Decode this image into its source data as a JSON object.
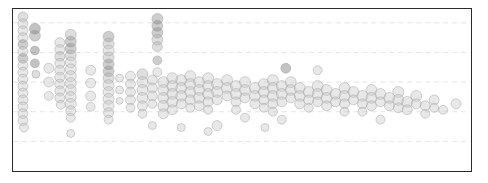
{
  "figure": {
    "title": "",
    "xlabel": "",
    "ylabel": "",
    "frame_color": "#2b2b2b",
    "background": "#ffffff",
    "gridline_color": "#d9d9d9"
  },
  "chart_data": {
    "type": "scatter",
    "title": "",
    "xlabel": "",
    "ylabel": "",
    "xlim": [
      0,
      460
    ],
    "ylim": [
      0,
      164
    ],
    "grid": true,
    "grid_orientation": "horizontal",
    "gridline_y": [
      14,
      44,
      74,
      104,
      134
    ],
    "legend": null,
    "marker": "circle",
    "marker_opacity": 0.42,
    "colors": {
      "light": "#c9c9c9",
      "mid": "#b0b0b0",
      "dark": "#8a8a8a",
      "darkest": "#6e6e6e"
    },
    "points": [
      {
        "x": 10,
        "y": 8,
        "r": 5.0,
        "c": "mid"
      },
      {
        "x": 10,
        "y": 15,
        "r": 5.0,
        "c": "light"
      },
      {
        "x": 10,
        "y": 22,
        "r": 5.0,
        "c": "light"
      },
      {
        "x": 10,
        "y": 29,
        "r": 5.0,
        "c": "light"
      },
      {
        "x": 10,
        "y": 36,
        "r": 5.0,
        "c": "dark"
      },
      {
        "x": 10,
        "y": 43,
        "r": 5.0,
        "c": "light"
      },
      {
        "x": 10,
        "y": 50,
        "r": 5.0,
        "c": "dark"
      },
      {
        "x": 10,
        "y": 57,
        "r": 5.0,
        "c": "light"
      },
      {
        "x": 10,
        "y": 64,
        "r": 5.0,
        "c": "light"
      },
      {
        "x": 10,
        "y": 71,
        "r": 5.0,
        "c": "light"
      },
      {
        "x": 10,
        "y": 78,
        "r": 5.0,
        "c": "light"
      },
      {
        "x": 10,
        "y": 85,
        "r": 5.0,
        "c": "light"
      },
      {
        "x": 10,
        "y": 92,
        "r": 5.0,
        "c": "light"
      },
      {
        "x": 10,
        "y": 99,
        "r": 5.0,
        "c": "light"
      },
      {
        "x": 10,
        "y": 106,
        "r": 5.0,
        "c": "light"
      },
      {
        "x": 10,
        "y": 113,
        "r": 5.0,
        "c": "light"
      },
      {
        "x": 11,
        "y": 120,
        "r": 4.5,
        "c": "light"
      },
      {
        "x": 22,
        "y": 20,
        "r": 5.5,
        "c": "darkest"
      },
      {
        "x": 22,
        "y": 27,
        "r": 5.5,
        "c": "dark"
      },
      {
        "x": 22,
        "y": 42,
        "r": 4.5,
        "c": "darkest"
      },
      {
        "x": 22,
        "y": 55,
        "r": 4.5,
        "c": "darkest"
      },
      {
        "x": 23,
        "y": 66,
        "r": 4.0,
        "c": "mid"
      },
      {
        "x": 47,
        "y": 34,
        "r": 5.0,
        "c": "light"
      },
      {
        "x": 47,
        "y": 41,
        "r": 5.0,
        "c": "light"
      },
      {
        "x": 47,
        "y": 48,
        "r": 5.0,
        "c": "mid"
      },
      {
        "x": 47,
        "y": 55,
        "r": 5.0,
        "c": "light"
      },
      {
        "x": 47,
        "y": 62,
        "r": 5.0,
        "c": "light"
      },
      {
        "x": 47,
        "y": 69,
        "r": 5.0,
        "c": "light"
      },
      {
        "x": 47,
        "y": 76,
        "r": 5.0,
        "c": "light"
      },
      {
        "x": 47,
        "y": 83,
        "r": 5.0,
        "c": "light"
      },
      {
        "x": 47,
        "y": 90,
        "r": 5.0,
        "c": "light"
      },
      {
        "x": 48,
        "y": 97,
        "r": 4.5,
        "c": "light"
      },
      {
        "x": 58,
        "y": 26,
        "r": 5.5,
        "c": "mid"
      },
      {
        "x": 58,
        "y": 33,
        "r": 5.5,
        "c": "dark"
      },
      {
        "x": 58,
        "y": 40,
        "r": 5.5,
        "c": "dark"
      },
      {
        "x": 58,
        "y": 47,
        "r": 5.5,
        "c": "mid"
      },
      {
        "x": 58,
        "y": 54,
        "r": 5.5,
        "c": "light"
      },
      {
        "x": 58,
        "y": 61,
        "r": 5.5,
        "c": "light"
      },
      {
        "x": 58,
        "y": 68,
        "r": 5.5,
        "c": "light"
      },
      {
        "x": 58,
        "y": 75,
        "r": 5.5,
        "c": "light"
      },
      {
        "x": 58,
        "y": 82,
        "r": 5.5,
        "c": "light"
      },
      {
        "x": 58,
        "y": 89,
        "r": 5.5,
        "c": "light"
      },
      {
        "x": 58,
        "y": 96,
        "r": 5.5,
        "c": "light"
      },
      {
        "x": 58,
        "y": 103,
        "r": 5.0,
        "c": "light"
      },
      {
        "x": 58,
        "y": 110,
        "r": 4.5,
        "c": "light"
      },
      {
        "x": 36,
        "y": 60,
        "r": 5.0,
        "c": "light"
      },
      {
        "x": 36,
        "y": 74,
        "r": 5.0,
        "c": "light"
      },
      {
        "x": 36,
        "y": 88,
        "r": 4.5,
        "c": "light"
      },
      {
        "x": 78,
        "y": 62,
        "r": 5.0,
        "c": "light"
      },
      {
        "x": 78,
        "y": 75,
        "r": 5.0,
        "c": "light"
      },
      {
        "x": 78,
        "y": 88,
        "r": 5.0,
        "c": "light"
      },
      {
        "x": 78,
        "y": 99,
        "r": 4.5,
        "c": "light"
      },
      {
        "x": 96,
        "y": 28,
        "r": 5.5,
        "c": "dark"
      },
      {
        "x": 96,
        "y": 35,
        "r": 5.5,
        "c": "mid"
      },
      {
        "x": 96,
        "y": 42,
        "r": 5.5,
        "c": "light"
      },
      {
        "x": 96,
        "y": 49,
        "r": 5.5,
        "c": "mid"
      },
      {
        "x": 96,
        "y": 56,
        "r": 5.5,
        "c": "dark"
      },
      {
        "x": 96,
        "y": 63,
        "r": 5.5,
        "c": "dark"
      },
      {
        "x": 96,
        "y": 70,
        "r": 5.5,
        "c": "mid"
      },
      {
        "x": 96,
        "y": 77,
        "r": 5.5,
        "c": "light"
      },
      {
        "x": 96,
        "y": 84,
        "r": 5.5,
        "c": "light"
      },
      {
        "x": 96,
        "y": 91,
        "r": 5.5,
        "c": "light"
      },
      {
        "x": 96,
        "y": 98,
        "r": 5.5,
        "c": "light"
      },
      {
        "x": 96,
        "y": 105,
        "r": 5.0,
        "c": "light"
      },
      {
        "x": 96,
        "y": 112,
        "r": 4.5,
        "c": "light"
      },
      {
        "x": 107,
        "y": 70,
        "r": 4.0,
        "c": "light"
      },
      {
        "x": 107,
        "y": 82,
        "r": 4.0,
        "c": "light"
      },
      {
        "x": 107,
        "y": 93,
        "r": 3.5,
        "c": "light"
      },
      {
        "x": 118,
        "y": 68,
        "r": 5.0,
        "c": "light"
      },
      {
        "x": 118,
        "y": 76,
        "r": 5.0,
        "c": "light"
      },
      {
        "x": 118,
        "y": 84,
        "r": 5.0,
        "c": "light"
      },
      {
        "x": 118,
        "y": 92,
        "r": 5.0,
        "c": "light"
      },
      {
        "x": 118,
        "y": 100,
        "r": 4.5,
        "c": "light"
      },
      {
        "x": 130,
        "y": 66,
        "r": 5.5,
        "c": "mid"
      },
      {
        "x": 130,
        "y": 74,
        "r": 5.5,
        "c": "light"
      },
      {
        "x": 130,
        "y": 82,
        "r": 5.5,
        "c": "light"
      },
      {
        "x": 130,
        "y": 90,
        "r": 5.5,
        "c": "light"
      },
      {
        "x": 130,
        "y": 98,
        "r": 5.0,
        "c": "light"
      },
      {
        "x": 130,
        "y": 106,
        "r": 4.5,
        "c": "light"
      },
      {
        "x": 140,
        "y": 72,
        "r": 5.0,
        "c": "light"
      },
      {
        "x": 140,
        "y": 80,
        "r": 5.0,
        "c": "light"
      },
      {
        "x": 140,
        "y": 88,
        "r": 5.0,
        "c": "light"
      },
      {
        "x": 140,
        "y": 96,
        "r": 4.5,
        "c": "light"
      },
      {
        "x": 145,
        "y": 10,
        "r": 5.5,
        "c": "dark"
      },
      {
        "x": 145,
        "y": 17,
        "r": 5.5,
        "c": "dark"
      },
      {
        "x": 145,
        "y": 24,
        "r": 5.5,
        "c": "dark"
      },
      {
        "x": 145,
        "y": 31,
        "r": 5.5,
        "c": "mid"
      },
      {
        "x": 145,
        "y": 38,
        "r": 5.0,
        "c": "mid"
      },
      {
        "x": 145,
        "y": 52,
        "r": 4.5,
        "c": "dark"
      },
      {
        "x": 145,
        "y": 64,
        "r": 4.5,
        "c": "light"
      },
      {
        "x": 151,
        "y": 74,
        "r": 5.5,
        "c": "light"
      },
      {
        "x": 151,
        "y": 82,
        "r": 5.5,
        "c": "light"
      },
      {
        "x": 151,
        "y": 90,
        "r": 5.5,
        "c": "light"
      },
      {
        "x": 151,
        "y": 98,
        "r": 5.5,
        "c": "light"
      },
      {
        "x": 151,
        "y": 106,
        "r": 5.0,
        "c": "light"
      },
      {
        "x": 160,
        "y": 70,
        "r": 5.5,
        "c": "light"
      },
      {
        "x": 160,
        "y": 78,
        "r": 5.5,
        "c": "light"
      },
      {
        "x": 160,
        "y": 86,
        "r": 5.5,
        "c": "light"
      },
      {
        "x": 160,
        "y": 94,
        "r": 5.5,
        "c": "light"
      },
      {
        "x": 160,
        "y": 102,
        "r": 5.0,
        "c": "light"
      },
      {
        "x": 169,
        "y": 72,
        "r": 5.5,
        "c": "light"
      },
      {
        "x": 169,
        "y": 80,
        "r": 5.5,
        "c": "light"
      },
      {
        "x": 169,
        "y": 88,
        "r": 5.5,
        "c": "light"
      },
      {
        "x": 169,
        "y": 96,
        "r": 5.0,
        "c": "light"
      },
      {
        "x": 178,
        "y": 68,
        "r": 5.5,
        "c": "light"
      },
      {
        "x": 178,
        "y": 76,
        "r": 5.5,
        "c": "light"
      },
      {
        "x": 178,
        "y": 84,
        "r": 5.5,
        "c": "light"
      },
      {
        "x": 178,
        "y": 92,
        "r": 5.0,
        "c": "light"
      },
      {
        "x": 178,
        "y": 100,
        "r": 4.5,
        "c": "light"
      },
      {
        "x": 187,
        "y": 74,
        "r": 5.5,
        "c": "light"
      },
      {
        "x": 187,
        "y": 82,
        "r": 5.5,
        "c": "light"
      },
      {
        "x": 187,
        "y": 90,
        "r": 5.5,
        "c": "light"
      },
      {
        "x": 187,
        "y": 98,
        "r": 5.0,
        "c": "light"
      },
      {
        "x": 196,
        "y": 70,
        "r": 5.5,
        "c": "light"
      },
      {
        "x": 196,
        "y": 78,
        "r": 5.5,
        "c": "light"
      },
      {
        "x": 196,
        "y": 86,
        "r": 5.5,
        "c": "light"
      },
      {
        "x": 196,
        "y": 94,
        "r": 5.0,
        "c": "light"
      },
      {
        "x": 196,
        "y": 102,
        "r": 4.5,
        "c": "light"
      },
      {
        "x": 205,
        "y": 76,
        "r": 5.5,
        "c": "light"
      },
      {
        "x": 205,
        "y": 84,
        "r": 5.5,
        "c": "light"
      },
      {
        "x": 205,
        "y": 92,
        "r": 5.0,
        "c": "light"
      },
      {
        "x": 205,
        "y": 118,
        "r": 5.0,
        "c": "light"
      },
      {
        "x": 215,
        "y": 72,
        "r": 5.5,
        "c": "light"
      },
      {
        "x": 215,
        "y": 80,
        "r": 5.5,
        "c": "light"
      },
      {
        "x": 215,
        "y": 88,
        "r": 5.0,
        "c": "light"
      },
      {
        "x": 224,
        "y": 78,
        "r": 5.5,
        "c": "light"
      },
      {
        "x": 224,
        "y": 86,
        "r": 5.5,
        "c": "light"
      },
      {
        "x": 224,
        "y": 94,
        "r": 5.0,
        "c": "light"
      },
      {
        "x": 224,
        "y": 102,
        "r": 4.5,
        "c": "light"
      },
      {
        "x": 233,
        "y": 74,
        "r": 5.5,
        "c": "light"
      },
      {
        "x": 233,
        "y": 82,
        "r": 5.5,
        "c": "light"
      },
      {
        "x": 233,
        "y": 90,
        "r": 5.0,
        "c": "light"
      },
      {
        "x": 233,
        "y": 110,
        "r": 4.5,
        "c": "light"
      },
      {
        "x": 243,
        "y": 80,
        "r": 5.5,
        "c": "light"
      },
      {
        "x": 243,
        "y": 88,
        "r": 5.5,
        "c": "light"
      },
      {
        "x": 243,
        "y": 96,
        "r": 5.0,
        "c": "light"
      },
      {
        "x": 252,
        "y": 76,
        "r": 5.5,
        "c": "light"
      },
      {
        "x": 252,
        "y": 84,
        "r": 5.5,
        "c": "light"
      },
      {
        "x": 252,
        "y": 92,
        "r": 5.0,
        "c": "light"
      },
      {
        "x": 252,
        "y": 100,
        "r": 4.5,
        "c": "light"
      },
      {
        "x": 261,
        "y": 72,
        "r": 5.5,
        "c": "light"
      },
      {
        "x": 261,
        "y": 80,
        "r": 5.5,
        "c": "light"
      },
      {
        "x": 261,
        "y": 88,
        "r": 5.5,
        "c": "light"
      },
      {
        "x": 261,
        "y": 96,
        "r": 5.0,
        "c": "light"
      },
      {
        "x": 261,
        "y": 104,
        "r": 4.5,
        "c": "light"
      },
      {
        "x": 270,
        "y": 78,
        "r": 5.5,
        "c": "light"
      },
      {
        "x": 270,
        "y": 86,
        "r": 5.5,
        "c": "light"
      },
      {
        "x": 270,
        "y": 94,
        "r": 5.0,
        "c": "light"
      },
      {
        "x": 270,
        "y": 112,
        "r": 4.5,
        "c": "light"
      },
      {
        "x": 279,
        "y": 74,
        "r": 5.5,
        "c": "light"
      },
      {
        "x": 279,
        "y": 82,
        "r": 5.5,
        "c": "light"
      },
      {
        "x": 279,
        "y": 90,
        "r": 5.0,
        "c": "light"
      },
      {
        "x": 274,
        "y": 60,
        "r": 5.0,
        "c": "darkest"
      },
      {
        "x": 288,
        "y": 80,
        "r": 5.5,
        "c": "light"
      },
      {
        "x": 288,
        "y": 88,
        "r": 5.5,
        "c": "light"
      },
      {
        "x": 288,
        "y": 96,
        "r": 5.0,
        "c": "light"
      },
      {
        "x": 297,
        "y": 84,
        "r": 5.5,
        "c": "light"
      },
      {
        "x": 297,
        "y": 92,
        "r": 5.0,
        "c": "light"
      },
      {
        "x": 297,
        "y": 100,
        "r": 4.5,
        "c": "light"
      },
      {
        "x": 306,
        "y": 78,
        "r": 5.5,
        "c": "light"
      },
      {
        "x": 306,
        "y": 86,
        "r": 5.5,
        "c": "light"
      },
      {
        "x": 306,
        "y": 94,
        "r": 5.0,
        "c": "light"
      },
      {
        "x": 306,
        "y": 62,
        "r": 4.5,
        "c": "light"
      },
      {
        "x": 315,
        "y": 82,
        "r": 5.5,
        "c": "light"
      },
      {
        "x": 315,
        "y": 90,
        "r": 5.5,
        "c": "light"
      },
      {
        "x": 315,
        "y": 98,
        "r": 5.0,
        "c": "light"
      },
      {
        "x": 324,
        "y": 86,
        "r": 5.5,
        "c": "light"
      },
      {
        "x": 324,
        "y": 94,
        "r": 5.0,
        "c": "light"
      },
      {
        "x": 333,
        "y": 80,
        "r": 5.5,
        "c": "light"
      },
      {
        "x": 333,
        "y": 88,
        "r": 5.5,
        "c": "light"
      },
      {
        "x": 333,
        "y": 96,
        "r": 5.0,
        "c": "light"
      },
      {
        "x": 333,
        "y": 104,
        "r": 4.5,
        "c": "light"
      },
      {
        "x": 342,
        "y": 84,
        "r": 5.5,
        "c": "light"
      },
      {
        "x": 342,
        "y": 92,
        "r": 5.0,
        "c": "light"
      },
      {
        "x": 351,
        "y": 88,
        "r": 5.5,
        "c": "light"
      },
      {
        "x": 351,
        "y": 96,
        "r": 5.0,
        "c": "light"
      },
      {
        "x": 351,
        "y": 104,
        "r": 4.5,
        "c": "light"
      },
      {
        "x": 360,
        "y": 82,
        "r": 5.5,
        "c": "light"
      },
      {
        "x": 360,
        "y": 90,
        "r": 5.5,
        "c": "light"
      },
      {
        "x": 360,
        "y": 98,
        "r": 5.0,
        "c": "light"
      },
      {
        "x": 369,
        "y": 86,
        "r": 5.5,
        "c": "light"
      },
      {
        "x": 369,
        "y": 94,
        "r": 5.0,
        "c": "light"
      },
      {
        "x": 369,
        "y": 112,
        "r": 4.5,
        "c": "light"
      },
      {
        "x": 378,
        "y": 90,
        "r": 5.5,
        "c": "light"
      },
      {
        "x": 378,
        "y": 98,
        "r": 5.0,
        "c": "light"
      },
      {
        "x": 387,
        "y": 84,
        "r": 5.5,
        "c": "light"
      },
      {
        "x": 387,
        "y": 92,
        "r": 5.5,
        "c": "light"
      },
      {
        "x": 387,
        "y": 100,
        "r": 5.0,
        "c": "light"
      },
      {
        "x": 396,
        "y": 94,
        "r": 5.5,
        "c": "light"
      },
      {
        "x": 396,
        "y": 102,
        "r": 5.0,
        "c": "light"
      },
      {
        "x": 405,
        "y": 88,
        "r": 5.5,
        "c": "light"
      },
      {
        "x": 405,
        "y": 96,
        "r": 5.0,
        "c": "light"
      },
      {
        "x": 414,
        "y": 98,
        "r": 5.0,
        "c": "light"
      },
      {
        "x": 414,
        "y": 106,
        "r": 4.5,
        "c": "light"
      },
      {
        "x": 423,
        "y": 92,
        "r": 5.0,
        "c": "light"
      },
      {
        "x": 423,
        "y": 100,
        "r": 4.5,
        "c": "light"
      },
      {
        "x": 432,
        "y": 102,
        "r": 4.5,
        "c": "light"
      },
      {
        "x": 445,
        "y": 96,
        "r": 5.0,
        "c": "light"
      },
      {
        "x": 253,
        "y": 120,
        "r": 4.0,
        "c": "light"
      },
      {
        "x": 140,
        "y": 118,
        "r": 4.0,
        "c": "light"
      },
      {
        "x": 169,
        "y": 120,
        "r": 4.0,
        "c": "light"
      },
      {
        "x": 196,
        "y": 124,
        "r": 4.0,
        "c": "light"
      },
      {
        "x": 58,
        "y": 126,
        "r": 4.0,
        "c": "light"
      }
    ]
  }
}
